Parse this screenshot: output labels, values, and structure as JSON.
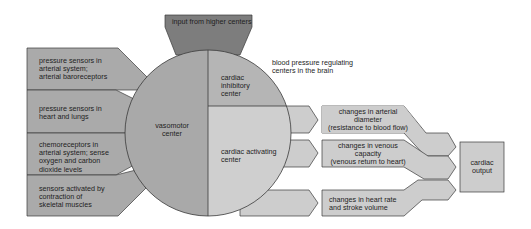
{
  "title": "blood pressure regulating centers in the brain",
  "colors": {
    "higher_centers": "#7d7d7d",
    "vasomotor": "#a9a9a9",
    "inhibitory": "#b5b5b5",
    "activating": "#cfcfcf",
    "inputs": "#aaaaaa",
    "outputs": "#cdcdcd",
    "outline": "#3a3a3a"
  },
  "top_input": {
    "label": "input from higher centers"
  },
  "brain_title": {
    "line1": "blood pressure regulating",
    "line2": "centers in the brain"
  },
  "centers": {
    "vasomotor": {
      "line1": "vasomotor",
      "line2": "center"
    },
    "inhibitory": {
      "line1": "cardiac",
      "line2": "inhibitory",
      "line3": "center"
    },
    "activating": {
      "line1": "cardiac activating",
      "line2": "center"
    }
  },
  "sensory_inputs": [
    {
      "line1": "pressure sensors in",
      "line2": "arterial system;",
      "line3": "arterial baroreceptors"
    },
    {
      "line1": "pressure sensors in",
      "line2": "heart and lungs"
    },
    {
      "line1": "chemoreceptors in",
      "line2": "arterial system; sense",
      "line3": "oxygen and carbon",
      "line4": "dioxide levels"
    },
    {
      "line1": "sensors activated by",
      "line2": "contraction of",
      "line3": "skeletal muscles"
    }
  ],
  "effects": [
    {
      "line1": "changes in arterial",
      "line2": "diameter",
      "line3": "(resistance to blood flow)"
    },
    {
      "line1": "changes in venous",
      "line2": "capacity",
      "line3": "(venous return to heart)"
    },
    {
      "line1": "changes in heart rate",
      "line2": "and stroke volume"
    }
  ],
  "output": {
    "line1": "cardiac",
    "line2": "output"
  }
}
